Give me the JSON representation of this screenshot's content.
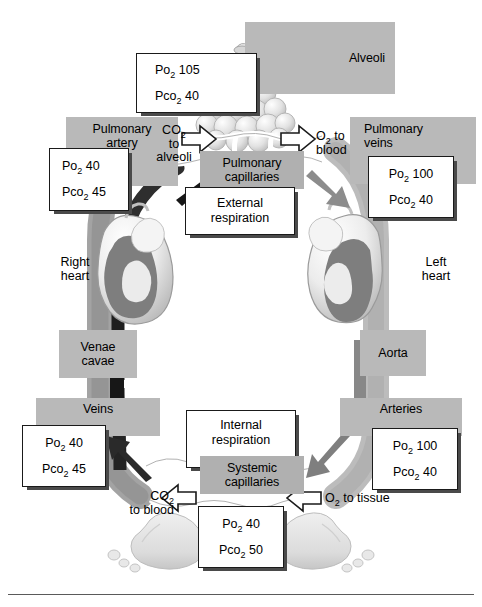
{
  "figure": {
    "background_color": "#ffffff",
    "plate_color": "#b9b9b9",
    "box_border_color": "#1a1a1a",
    "deoxygenated_vessel_color": "#4a4a4a",
    "oxygenated_vessel_color": "#8f8f8f"
  },
  "plates": {
    "alveoli": "Alveoli",
    "pulmonary_artery": "Pulmonary\nartery",
    "pulmonary_artery_l1": "Pulmonary",
    "pulmonary_artery_l2": "artery",
    "pulmonary_veins_l1": "Pulmonary",
    "pulmonary_veins_l2": "veins",
    "pulmonary_capillaries_l1": "Pulmonary",
    "pulmonary_capillaries_l2": "capillaries",
    "venae_cavae_l1": "Venae",
    "venae_cavae_l2": "cavae",
    "aorta": "Aorta",
    "veins": "Veins",
    "arteries": "Arteries",
    "systemic_capillaries_l1": "Systemic",
    "systemic_capillaries_l2": "capillaries"
  },
  "plain_labels": {
    "right_heart_l1": "Right",
    "right_heart_l2": "heart",
    "left_heart_l1": "Left",
    "left_heart_l2": "heart"
  },
  "process_boxes": {
    "external_respiration_l1": "External",
    "external_respiration_l2": "respiration",
    "internal_respiration_l1": "Internal",
    "internal_respiration_l2": "respiration"
  },
  "arrow_labels": {
    "co2_to_alveoli_l1": "CO",
    "co2_to_alveoli_sub": "2",
    "co2_to_alveoli_l2": "to",
    "co2_to_alveoli_l3": "alveoli",
    "o2_to_blood_l1": "O",
    "o2_to_blood_sub": "2",
    "o2_to_blood_l1b": " to",
    "o2_to_blood_l2": "blood",
    "co2_to_blood_l1": "CO",
    "co2_to_blood_sub": "2",
    "co2_to_blood_l2": "to blood",
    "o2_to_tissue": "O",
    "o2_to_tissue_sub": "2",
    "o2_to_tissue_rest": " to tissue"
  },
  "gas_values": {
    "alveoli": {
      "po2_label": "Po",
      "po2_sub": "2",
      "po2_value": "105",
      "pco2_label": "Pco",
      "pco2_sub": "2",
      "pco2_value": "40"
    },
    "pulmonary_artery": {
      "po2_label": "Po",
      "po2_sub": "2",
      "po2_value": "40",
      "pco2_label": "Pco",
      "pco2_sub": "2",
      "pco2_value": "45"
    },
    "pulmonary_veins": {
      "po2_label": "Po",
      "po2_sub": "2",
      "po2_value": "100",
      "pco2_label": "Pco",
      "pco2_sub": "2",
      "pco2_value": "40"
    },
    "veins": {
      "po2_label": "Po",
      "po2_sub": "2",
      "po2_value": "40",
      "pco2_label": "Pco",
      "pco2_sub": "2",
      "pco2_value": "45"
    },
    "arteries": {
      "po2_label": "Po",
      "po2_sub": "2",
      "po2_value": "100",
      "pco2_label": "Pco",
      "pco2_sub": "2",
      "pco2_value": "40"
    },
    "tissues": {
      "po2_label": "Po",
      "po2_sub": "2",
      "po2_value": "40",
      "pco2_label": "Pco",
      "pco2_sub": "2",
      "pco2_value": "50"
    }
  }
}
